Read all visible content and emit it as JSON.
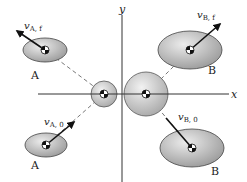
{
  "diagram": {
    "axes": {
      "x_label": "x",
      "y_label": "y"
    },
    "bodies": {
      "A_final": {
        "name": "A",
        "velocity_symbol": "v",
        "velocity_subscript": "A, f"
      },
      "B_final": {
        "name": "B",
        "velocity_symbol": "v",
        "velocity_subscript": "B, f"
      },
      "A_initial": {
        "name": "A",
        "velocity_symbol": "v",
        "velocity_subscript": "A, 0"
      },
      "B_initial": {
        "name": "B",
        "velocity_symbol": "v",
        "velocity_subscript": "B, 0"
      }
    },
    "colors": {
      "body_fill_light": "#e6e6e6",
      "body_fill_dark": "#9a9a9a",
      "outline": "#444444",
      "axis": "#333333",
      "arrow": "#111111"
    }
  }
}
